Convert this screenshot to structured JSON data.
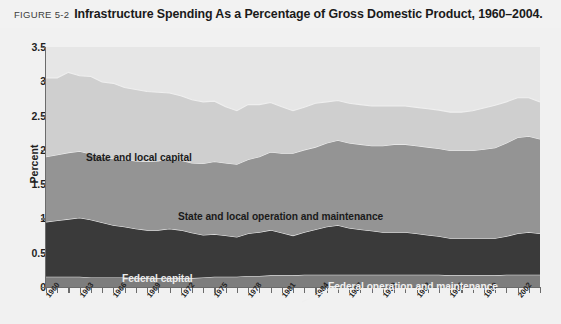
{
  "figure": {
    "number": "FIGURE 5-2",
    "title": "Infrastructure Spending As a Percentage of Gross Domestic Product, 1960–2004."
  },
  "axes": {
    "ylabel": "Percent",
    "y_ticks": [
      "3.5",
      "3",
      "2.5",
      "2",
      "1.5",
      "1",
      "0.5",
      "0"
    ],
    "x_ticks": [
      "1960",
      "1963",
      "1966",
      "1969",
      "1972",
      "1975",
      "1978",
      "1981",
      "1984",
      "1987",
      "1990",
      "1993",
      "1996",
      "1999",
      "2002"
    ]
  },
  "series_labels": {
    "state_local_capital": "State and local capital",
    "state_local_om": "State and local operation and maintenance",
    "federal_capital": "Federal capital",
    "federal_om": "Federal operation and maintenance"
  },
  "colors": {
    "plot_background": "#e6e6e6",
    "state_local_capital": "#cfcfcf",
    "state_local_om": "#949494",
    "federal_capital": "#3a3a3a",
    "federal_om": "#7d7d7d",
    "axis": "#6b6b6b",
    "page_background": "#f1f1f1"
  },
  "chart_data": {
    "type": "area",
    "title": "Infrastructure Spending As a Percentage of Gross Domestic Product, 1960–2004.",
    "xlabel": "",
    "ylabel": "Percent",
    "ylim": [
      0,
      3.5
    ],
    "xlim": [
      1960,
      2004
    ],
    "grid": false,
    "legend_position": "inline-labels",
    "stacked": true,
    "stack_order_bottom_to_top": [
      "Federal operation and maintenance",
      "Federal capital",
      "State and local operation and maintenance",
      "State and local capital"
    ],
    "x": [
      1960,
      1961,
      1962,
      1963,
      1964,
      1965,
      1966,
      1967,
      1968,
      1969,
      1970,
      1971,
      1972,
      1973,
      1974,
      1975,
      1976,
      1977,
      1978,
      1979,
      1980,
      1981,
      1982,
      1983,
      1984,
      1985,
      1986,
      1987,
      1988,
      1989,
      1990,
      1991,
      1992,
      1993,
      1994,
      1995,
      1996,
      1997,
      1998,
      1999,
      2000,
      2001,
      2002,
      2003,
      2004
    ],
    "series": [
      {
        "name": "Federal operation and maintenance",
        "color": "#7d7d7d",
        "values": [
          0.15,
          0.15,
          0.15,
          0.15,
          0.14,
          0.14,
          0.14,
          0.14,
          0.13,
          0.13,
          0.13,
          0.13,
          0.13,
          0.13,
          0.14,
          0.15,
          0.15,
          0.15,
          0.16,
          0.16,
          0.17,
          0.17,
          0.17,
          0.18,
          0.18,
          0.18,
          0.18,
          0.18,
          0.18,
          0.18,
          0.18,
          0.18,
          0.18,
          0.18,
          0.18,
          0.18,
          0.17,
          0.17,
          0.17,
          0.17,
          0.17,
          0.18,
          0.18,
          0.18,
          0.18
        ]
      },
      {
        "name": "Federal capital",
        "color": "#3a3a3a",
        "values": [
          0.8,
          0.82,
          0.84,
          0.86,
          0.84,
          0.8,
          0.76,
          0.74,
          0.72,
          0.7,
          0.7,
          0.72,
          0.7,
          0.66,
          0.62,
          0.62,
          0.6,
          0.58,
          0.62,
          0.64,
          0.66,
          0.62,
          0.58,
          0.62,
          0.66,
          0.7,
          0.72,
          0.68,
          0.66,
          0.64,
          0.62,
          0.62,
          0.62,
          0.6,
          0.58,
          0.56,
          0.54,
          0.54,
          0.54,
          0.54,
          0.54,
          0.56,
          0.6,
          0.62,
          0.6
        ]
      },
      {
        "name": "State and local operation and maintenance",
        "color": "#949494",
        "values": [
          0.95,
          0.96,
          0.97,
          0.97,
          0.96,
          0.96,
          0.97,
          0.98,
          0.99,
          1.0,
          1.01,
          1.02,
          1.02,
          1.02,
          1.04,
          1.06,
          1.06,
          1.06,
          1.08,
          1.1,
          1.14,
          1.16,
          1.2,
          1.2,
          1.2,
          1.22,
          1.24,
          1.24,
          1.24,
          1.24,
          1.26,
          1.28,
          1.28,
          1.28,
          1.28,
          1.28,
          1.28,
          1.28,
          1.28,
          1.3,
          1.32,
          1.36,
          1.4,
          1.4,
          1.38
        ]
      },
      {
        "name": "State and local capital",
        "color": "#cfcfcf",
        "values": [
          1.15,
          1.12,
          1.17,
          1.1,
          1.13,
          1.09,
          1.1,
          1.05,
          1.04,
          1.02,
          1.0,
          0.96,
          0.94,
          0.92,
          0.9,
          0.88,
          0.82,
          0.78,
          0.8,
          0.76,
          0.72,
          0.68,
          0.62,
          0.62,
          0.64,
          0.6,
          0.58,
          0.58,
          0.58,
          0.58,
          0.58,
          0.56,
          0.56,
          0.56,
          0.56,
          0.56,
          0.56,
          0.56,
          0.58,
          0.6,
          0.62,
          0.6,
          0.58,
          0.56,
          0.54
        ]
      }
    ],
    "totals": [
      3.05,
      3.05,
      3.13,
      3.08,
      3.07,
      2.99,
      2.97,
      2.91,
      2.88,
      2.85,
      2.84,
      2.83,
      2.79,
      2.73,
      2.7,
      2.71,
      2.63,
      2.57,
      2.66,
      2.66,
      2.69,
      2.63,
      2.57,
      2.62,
      2.68,
      2.7,
      2.72,
      2.68,
      2.66,
      2.64,
      2.64,
      2.64,
      2.64,
      2.62,
      2.6,
      2.58,
      2.55,
      2.55,
      2.57,
      2.61,
      2.65,
      2.7,
      2.76,
      2.76,
      2.7
    ]
  }
}
